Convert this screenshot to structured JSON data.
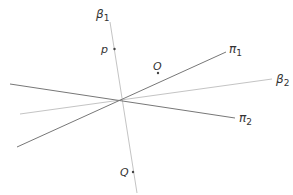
{
  "figure": {
    "colors": {
      "background": "#ffffff",
      "dark_line": "#777777",
      "light_line": "#c4c4c4",
      "text": "#333333",
      "point": "#444444"
    },
    "lines": [
      {
        "id": "beta1",
        "symbol": "β",
        "subscript": "1",
        "style": "light"
      },
      {
        "id": "beta2",
        "symbol": "β",
        "subscript": "2",
        "style": "light"
      },
      {
        "id": "pi1",
        "symbol": "π",
        "subscript": "1",
        "style": "dark"
      },
      {
        "id": "pi2",
        "symbol": "π",
        "subscript": "2",
        "style": "dark"
      }
    ],
    "points": [
      {
        "id": "p",
        "label": "p",
        "on_line": "beta1"
      },
      {
        "id": "O",
        "label": "O",
        "on_line": null
      },
      {
        "id": "Q",
        "label": "Q",
        "on_line": "beta1"
      }
    ]
  }
}
